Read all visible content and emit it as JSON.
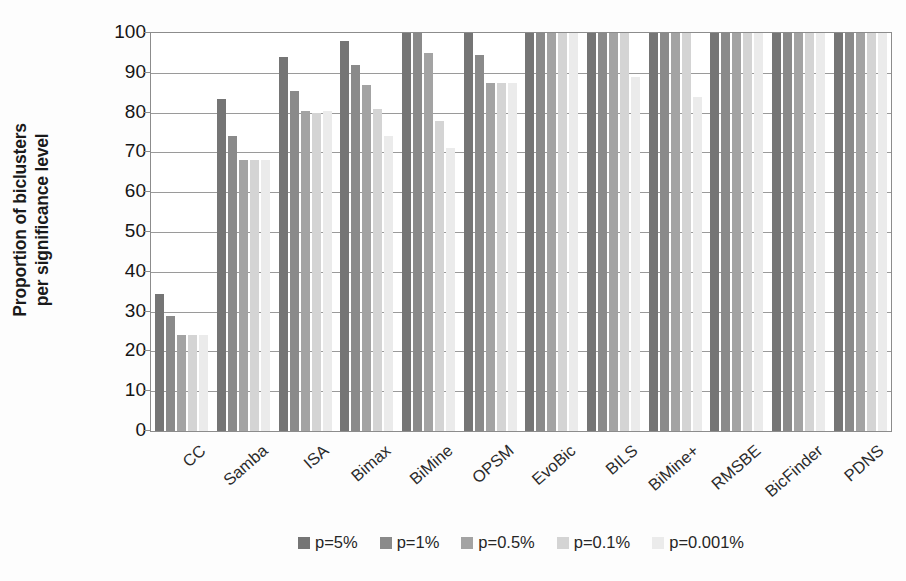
{
  "chart_data": {
    "type": "bar",
    "title": "",
    "subtitle": "",
    "xlabel": "",
    "ylabel": "Proportion of biclusters per significance level",
    "ylabel_line1": "Proportion of biclusters",
    "ylabel_line2": "per significance level",
    "ylim": [
      0,
      100
    ],
    "ytick_step": 10,
    "ytick_labels": [
      "100",
      "90",
      "80",
      "70",
      "60",
      "50",
      "40",
      "30",
      "20",
      "10",
      "0"
    ],
    "ytick_values": [
      100,
      90,
      80,
      70,
      60,
      50,
      40,
      30,
      20,
      10,
      0
    ],
    "grid": true,
    "grid_axis": "y",
    "legend_position": "bottom",
    "categories": [
      "CC",
      "Samba",
      "ISA",
      "Bimax",
      "BiMine",
      "OPSM",
      "EvoBic",
      "BILS",
      "BiMine+",
      "RMSBE",
      "BicFinder",
      "PDNS"
    ],
    "series": [
      {
        "name": "p=5%",
        "color": "#757575",
        "values": [
          34.5,
          83.5,
          94.0,
          98.0,
          100.0,
          100.0,
          100.0,
          100.0,
          100.0,
          100.0,
          100.0,
          100.0
        ]
      },
      {
        "name": "p=1%",
        "color": "#8a8a8a",
        "values": [
          29.0,
          74.0,
          85.5,
          92.0,
          100.0,
          94.5,
          100.0,
          100.0,
          100.0,
          100.0,
          100.0,
          100.0
        ]
      },
      {
        "name": "p=0.5%",
        "color": "#a3a3a3",
        "values": [
          24.0,
          68.0,
          80.5,
          87.0,
          95.0,
          87.5,
          100.0,
          100.0,
          100.0,
          100.0,
          100.0,
          100.0
        ]
      },
      {
        "name": "p=0.1%",
        "color": "#d4d4d4",
        "values": [
          24.0,
          68.0,
          80.0,
          81.0,
          78.0,
          87.5,
          100.0,
          100.0,
          100.0,
          100.0,
          100.0,
          100.0
        ]
      },
      {
        "name": "p=0.001%",
        "color": "#ebebeb",
        "values": [
          24.0,
          68.0,
          80.5,
          74.0,
          71.0,
          87.5,
          100.0,
          89.0,
          84.0,
          100.0,
          100.0,
          100.0
        ]
      }
    ],
    "legend": [
      {
        "label": "p=5%",
        "color": "#757575"
      },
      {
        "label": "p=1%",
        "color": "#8a8a8a"
      },
      {
        "label": "p=0.5%",
        "color": "#a3a3a3"
      },
      {
        "label": "p=0.1%",
        "color": "#d4d4d4"
      },
      {
        "label": "p=0.001%",
        "color": "#ebebeb"
      }
    ]
  }
}
